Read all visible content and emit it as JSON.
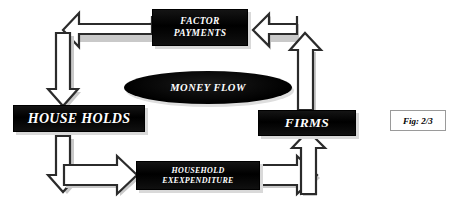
{
  "figure": {
    "caption": "Fig: 2/3"
  },
  "nodes": {
    "factor_payments": {
      "line1": "FACTOR",
      "line2": "PAYMENTS"
    },
    "money_flow": {
      "label": "MONEY FLOW"
    },
    "households": {
      "label": "HOUSE HOLDS"
    },
    "firms": {
      "label": "FIRMS"
    },
    "household_expenditure": {
      "line1": "HOUSEHOLD",
      "line2": "EXEXPENDITURE"
    }
  },
  "arrows": [
    {
      "name": "factor-payments-to-households",
      "direction": "left-then-down",
      "from": "factor_payments",
      "to": "households"
    },
    {
      "name": "firms-to-factor-payments",
      "direction": "left",
      "from": "firms",
      "to": "factor_payments"
    },
    {
      "name": "firms-up",
      "direction": "up",
      "from": "firms",
      "to": "factor_payments"
    },
    {
      "name": "households-down",
      "direction": "down",
      "from": "households",
      "to": "household_expenditure"
    },
    {
      "name": "households-to-expenditure",
      "direction": "right",
      "from": "households",
      "to": "household_expenditure"
    },
    {
      "name": "expenditure-to-firms",
      "direction": "right",
      "from": "household_expenditure",
      "to": "firms"
    },
    {
      "name": "expenditure-up-to-firms",
      "direction": "up",
      "from": "household_expenditure",
      "to": "firms"
    }
  ],
  "colors": {
    "box_fill": "#0b0b0b",
    "box_text": "#ffffff",
    "box_shadow": "#d9d9d9",
    "arrow_fill": "#ffffff",
    "arrow_stroke": "#2b2b2b",
    "arrow_shadow": "#c9c9c9",
    "caption_border": "#9a9a9a",
    "background": "#ffffff"
  }
}
